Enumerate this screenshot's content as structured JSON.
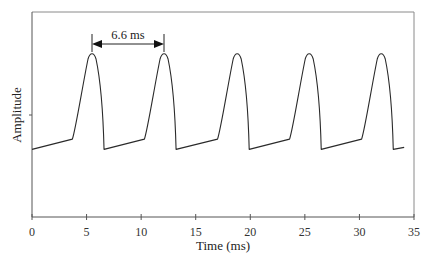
{
  "chart_data": {
    "type": "line",
    "title": "",
    "xlabel": "Time (ms)",
    "ylabel": "Amplitude",
    "xlim": [
      0,
      35
    ],
    "ylim": [
      0,
      1
    ],
    "x_ticks": [
      0,
      5,
      10,
      15,
      20,
      25,
      30,
      35
    ],
    "x_tick_labels": [
      "0",
      "5",
      "10",
      "15",
      "20",
      "25",
      "30",
      "35"
    ],
    "y_ticks": [
      0.5
    ],
    "y_tick_labels": [],
    "grid": false,
    "legend": null,
    "series": [
      {
        "name": "waveform",
        "description": "Periodic pulse waveform: slow linear rise, sharp rounded peak, abrupt drop",
        "period_ms": 6.6,
        "peak_times_ms": [
          5.5,
          12.1,
          18.8,
          25.4,
          32.0
        ],
        "trough_times_ms": [
          0.0,
          6.6,
          13.2,
          19.9,
          26.5,
          33.1
        ],
        "peak_amplitude": 0.8,
        "trough_amplitude": 0.33,
        "knee_amplitude": 0.38,
        "end_time_ms": 34.1
      }
    ],
    "annotations": [
      {
        "text": "6.6 ms",
        "type": "double-arrow",
        "x_start_ms": 5.5,
        "x_end_ms": 12.1
      }
    ]
  },
  "labels": {
    "xlabel": "Time (ms)",
    "ylabel": "Amplitude",
    "annotation": "6.6 ms",
    "xticks": [
      "0",
      "5",
      "10",
      "15",
      "20",
      "25",
      "30",
      "35"
    ]
  },
  "colors": {
    "line": "#2a2a2a",
    "axis": "#555555",
    "frame": "#888888"
  }
}
